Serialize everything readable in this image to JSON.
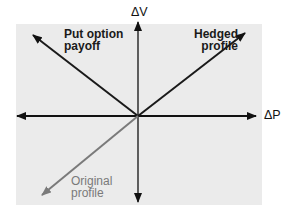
{
  "diagram": {
    "axes": {
      "x_label": "ΔP",
      "y_label": "ΔV"
    },
    "lines": [
      {
        "name": "Put option payoff",
        "line1": "Put option",
        "line2": "payoff",
        "color": "#1a1a1a",
        "direction": "up-left"
      },
      {
        "name": "Hedged profile",
        "line1": "Hedged",
        "line2": "profile",
        "color": "#1a1a1a",
        "direction": "up-right"
      },
      {
        "name": "Original profile",
        "line1": "Original",
        "line2": "profile",
        "color": "#7a7a7a",
        "direction": "down-left"
      }
    ],
    "colors": {
      "background_panel": "#ebebeb",
      "axis": "#111111",
      "primary_line": "#1a1a1a",
      "original_line": "#7a7a7a"
    }
  }
}
